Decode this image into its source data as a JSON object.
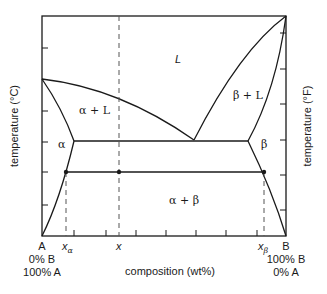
{
  "diagram": {
    "type": "binary eutectic phase diagram",
    "axes": {
      "left_label": "temperature (°C)",
      "right_label": "temperature (°F)",
      "bottom_label": "composition (wt%)"
    },
    "regions": {
      "liquid": "L",
      "alpha_liquid": "α + L",
      "beta_liquid": "β + L",
      "alpha": "α",
      "beta": "β",
      "alpha_beta": "α + β"
    },
    "x_axis_labels": {
      "left_end": "A",
      "left_sub1": "0% B",
      "left_sub2": "100% A",
      "right_end": "B",
      "right_sub1": "100% B",
      "right_sub2": "0% A",
      "x_alpha": "x",
      "x_alpha_sub": "α",
      "x": "x",
      "x_beta": "x",
      "x_beta_sub": "β"
    },
    "colors": {
      "line": "#1a1a1a",
      "dashed": "#555555",
      "background": "#ffffff"
    }
  }
}
